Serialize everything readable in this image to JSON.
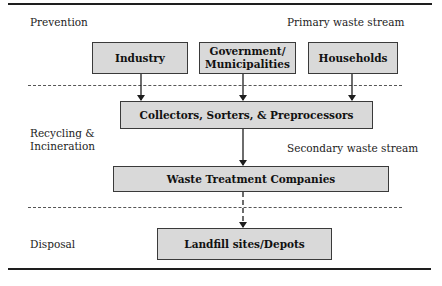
{
  "layers": {
    "prevention": "Prevention",
    "recycling_line1": "Recycling &",
    "recycling_line2": "Incineration",
    "disposal": "Disposal"
  },
  "streams": {
    "primary": "Primary waste stream",
    "secondary": "Secondary waste stream"
  },
  "nodes": {
    "industry": "Industry",
    "government_line1": "Government/",
    "government_line2": "Municipalities",
    "households": "Households",
    "collectors": "Collectors, Sorters, & Preprocessors",
    "waste_treatment": "Waste Treatment Companies",
    "landfill": "Landfill sites/Depots"
  },
  "edges": [
    {
      "from": "Industry",
      "to": "Collectors, Sorters, & Preprocessors",
      "style": "solid"
    },
    {
      "from": "Government/Municipalities",
      "to": "Collectors, Sorters, & Preprocessors",
      "style": "solid"
    },
    {
      "from": "Households",
      "to": "Collectors, Sorters, & Preprocessors",
      "style": "solid"
    },
    {
      "from": "Collectors, Sorters, & Preprocessors",
      "to": "Waste Treatment Companies",
      "style": "solid"
    },
    {
      "from": "Waste Treatment Companies",
      "to": "Landfill sites/Depots",
      "style": "dashed"
    }
  ],
  "colors": {
    "box_fill": "#d9d9d9",
    "box_border": "#3a3a3a",
    "line": "#1e1e1e"
  }
}
